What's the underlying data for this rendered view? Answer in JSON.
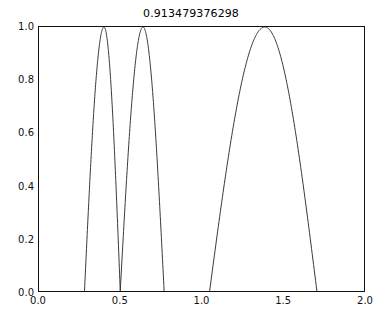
{
  "figure": {
    "background_color": "#ffffff",
    "frame_color": "#111111",
    "line_color": "#3a3a3a"
  },
  "chart_data": {
    "type": "line",
    "title": "0.913479376298",
    "xlabel": "",
    "ylabel": "",
    "xlim": [
      0.0,
      2.0
    ],
    "ylim": [
      0.0,
      1.0
    ],
    "xticks": [
      "0.0",
      "0.5",
      "1.0",
      "1.5",
      "2.0"
    ],
    "xtick_values": [
      0.0,
      0.5,
      1.0,
      1.5,
      2.0
    ],
    "yticks": [
      "0.0",
      "0.2",
      "0.4",
      "0.6",
      "0.8",
      "1.0"
    ],
    "ytick_values": [
      0.0,
      0.2,
      0.4,
      0.6,
      0.8,
      1.0
    ],
    "grid": false,
    "legend": "none",
    "series": [
      {
        "name": "curve",
        "color": "#3a3a3a",
        "linewidth": 1,
        "description": "three positive lobes clipped at y=0",
        "lobes": [
          {
            "zero_left": 0.28,
            "peak_x": 0.4,
            "peak_y": 1.0,
            "zero_right": 0.5
          },
          {
            "zero_left": 0.5,
            "peak_x": 0.64,
            "peak_y": 1.0,
            "zero_right": 0.77
          },
          {
            "zero_left": 1.05,
            "peak_x": 1.39,
            "peak_y": 1.0,
            "zero_right": 1.71
          }
        ],
        "x": [
          0.28,
          0.3,
          0.32,
          0.34,
          0.36,
          0.38,
          0.4,
          0.42,
          0.44,
          0.46,
          0.48,
          0.5,
          0.52,
          0.54,
          0.56,
          0.58,
          0.6,
          0.62,
          0.64,
          0.66,
          0.68,
          0.7,
          0.72,
          0.74,
          0.77,
          1.05,
          1.1,
          1.15,
          1.2,
          1.25,
          1.3,
          1.35,
          1.39,
          1.43,
          1.48,
          1.53,
          1.58,
          1.63,
          1.67,
          1.71
        ],
        "y": [
          0.0,
          0.3,
          0.58,
          0.8,
          0.94,
          0.99,
          1.0,
          0.97,
          0.87,
          0.7,
          0.44,
          0.0,
          0.22,
          0.48,
          0.7,
          0.86,
          0.96,
          1.0,
          1.0,
          0.97,
          0.9,
          0.78,
          0.6,
          0.36,
          0.0,
          0.0,
          0.21,
          0.41,
          0.59,
          0.75,
          0.88,
          0.97,
          1.0,
          0.99,
          0.93,
          0.82,
          0.66,
          0.45,
          0.25,
          0.0
        ]
      }
    ]
  }
}
